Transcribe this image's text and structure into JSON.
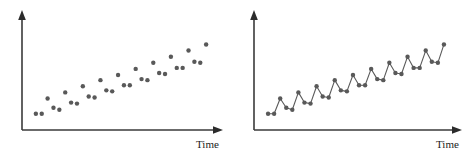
{
  "figure": {
    "background_color": "#ffffff",
    "width": 472,
    "height": 156,
    "panels": [
      {
        "id": "scatter",
        "name": "left-scatter-panel"
      },
      {
        "id": "line",
        "name": "right-line-panel"
      }
    ]
  },
  "axes": {
    "x_caption": "Time",
    "y_caption": "",
    "axis_color": "#3a3a3a",
    "arrow_color": "#2b2b2b",
    "x_has_arrow": true,
    "y_has_arrow": true,
    "ticks_visible": false,
    "grid_visible": false
  },
  "style": {
    "marker_color": "#595959",
    "line_color": "#5a5a5a",
    "marker_radius": 2.2,
    "line_width": 1.1
  },
  "chart_data": [
    {
      "type": "scatter",
      "title": "",
      "subtitle": "",
      "xlabel": "Time",
      "ylabel": "",
      "xlim": [
        0,
        31
      ],
      "ylim": [
        0,
        100
      ],
      "grid": false,
      "legend": "none",
      "annotations": [],
      "series": [
        {
          "name": "Seasonal series with upward trend",
          "x": [
            1,
            2,
            3,
            4,
            5,
            6,
            7,
            8,
            9,
            10,
            11,
            12,
            13,
            14,
            15,
            16,
            17,
            18,
            19,
            20,
            21,
            22,
            23,
            24,
            25,
            26,
            27,
            28,
            29,
            30
          ],
          "values": [
            10,
            10,
            25,
            16,
            14,
            31,
            21,
            20,
            37,
            27,
            26,
            43,
            33,
            32,
            48,
            38,
            38,
            54,
            44,
            43,
            60,
            50,
            49,
            66,
            55,
            55,
            72,
            61,
            60,
            78
          ]
        }
      ]
    },
    {
      "type": "line",
      "title": "",
      "subtitle": "",
      "xlabel": "Time",
      "ylabel": "",
      "xlim": [
        0,
        31
      ],
      "ylim": [
        0,
        100
      ],
      "grid": false,
      "legend": "none",
      "markers": true,
      "annotations": [],
      "series": [
        {
          "name": "Seasonal series with upward trend",
          "x": [
            1,
            2,
            3,
            4,
            5,
            6,
            7,
            8,
            9,
            10,
            11,
            12,
            13,
            14,
            15,
            16,
            17,
            18,
            19,
            20,
            21,
            22,
            23,
            24,
            25,
            26,
            27,
            28,
            29,
            30
          ],
          "values": [
            10,
            10,
            25,
            16,
            14,
            31,
            21,
            20,
            37,
            27,
            26,
            43,
            33,
            32,
            48,
            38,
            38,
            54,
            44,
            43,
            60,
            50,
            49,
            66,
            55,
            55,
            72,
            61,
            60,
            78
          ]
        }
      ]
    }
  ]
}
